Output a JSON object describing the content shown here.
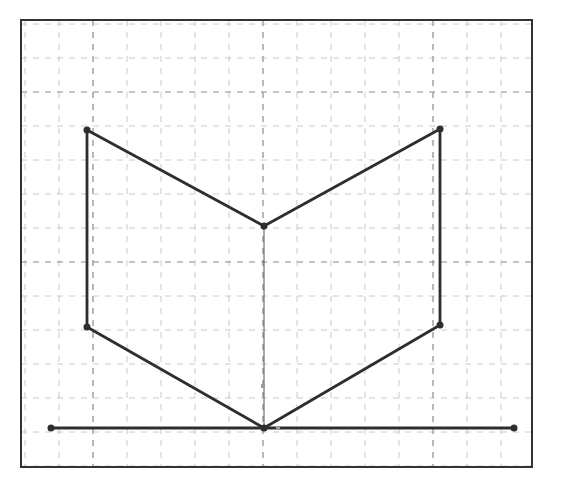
{
  "diagram": {
    "type": "geometric-construction",
    "frame": {
      "x": 21,
      "y": 20,
      "w": 511,
      "h": 447
    },
    "grid": {
      "minor_spacing": 34,
      "origin_x": 25,
      "origin_y": 24,
      "major_x": [
        93,
        263,
        433
      ],
      "major_y": [
        92,
        260,
        428
      ]
    },
    "colors": {
      "line": "#2e2e2e",
      "grid": "#bdbdbd",
      "grid_major": "#8a8a8a",
      "frame": "#333333",
      "marker": "#9a9a9a"
    },
    "points": {
      "A": [
        87,
        130
      ],
      "B": [
        440,
        129
      ],
      "C": [
        87,
        327
      ],
      "D": [
        440,
        325
      ],
      "O": [
        264,
        226
      ],
      "P": [
        264,
        428
      ],
      "L": [
        51,
        428
      ],
      "R": [
        514,
        428
      ]
    },
    "segments": [
      [
        "A",
        "O"
      ],
      [
        "O",
        "B"
      ],
      [
        "A",
        "C"
      ],
      [
        "B",
        "D"
      ],
      [
        "C",
        "P"
      ],
      [
        "D",
        "P"
      ],
      [
        "L",
        "R"
      ]
    ],
    "thin_segments": [
      [
        "O",
        "P"
      ]
    ],
    "small_markers": [
      [
        263,
        386
      ],
      [
        278,
        428
      ]
    ]
  }
}
